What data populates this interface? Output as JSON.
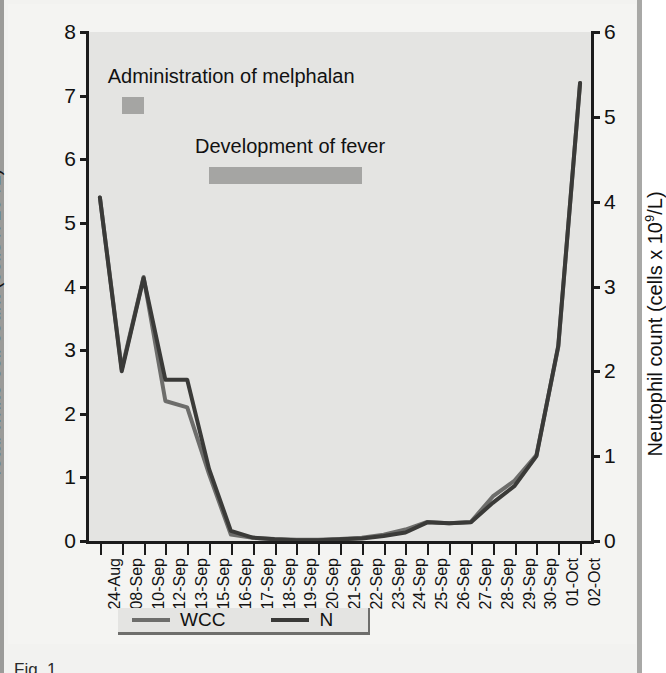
{
  "figure": {
    "background_color": "#f4f4f2",
    "plot_background_color": "#e4e4e2",
    "axis_color": "#1c1c1c"
  },
  "annotations": [
    {
      "name": "melphalan",
      "text": "Administration of melphalan",
      "bar_color": "#a5a5a3",
      "bar_start_category": "08-Sep",
      "bar_end_category": "10-Sep",
      "bar_y_value": 6.85
    },
    {
      "name": "fever",
      "text": "Development of fever",
      "bar_color": "#a5a5a3",
      "bar_start_category": "15-Sep",
      "bar_end_category": "22-Sep",
      "bar_y_value": 5.75
    }
  ],
  "legend": {
    "position": "below-axis",
    "items": [
      {
        "label": "WCC",
        "color": "#6d6d6b"
      },
      {
        "label": "N",
        "color": "#3a3a38"
      }
    ]
  },
  "caption": {
    "text": "Fig. 1"
  },
  "chart_data": {
    "type": "line",
    "title": "",
    "xlabel": "",
    "ylabel": "Total white cell count (cells x 10⁹/L)",
    "y2label": "Neutophil count (cells x 10⁹/L)",
    "ylim": [
      0,
      8
    ],
    "y2lim": [
      0,
      6
    ],
    "yticks": [
      0,
      1,
      2,
      3,
      4,
      5,
      6,
      7,
      8
    ],
    "y2ticks": [
      0,
      1,
      2,
      3,
      4,
      5,
      6
    ],
    "grid": false,
    "legend_position": "bottom",
    "categories": [
      "24-Aug",
      "08-Sep",
      "10-Sep",
      "12-Sep",
      "13-Sep",
      "15-Sep",
      "16-Sep",
      "17-Sep",
      "18-Sep",
      "19-Sep",
      "20-Sep",
      "21-Sep",
      "22-Sep",
      "23-Sep",
      "24-Sep",
      "25-Sep",
      "26-Sep",
      "27-Sep",
      "28-Sep",
      "29-Sep",
      "30-Sep",
      "01-Oct",
      "02-Oct"
    ],
    "series": [
      {
        "name": "WCC",
        "axis": "left",
        "color": "#6d6d6b",
        "values": [
          5.4,
          2.7,
          4.15,
          2.2,
          2.1,
          1.05,
          0.1,
          0.05,
          0.03,
          0.02,
          0.02,
          0.03,
          0.05,
          0.1,
          0.18,
          0.3,
          0.28,
          0.3,
          0.7,
          0.95,
          1.35,
          3.05,
          7.2
        ]
      },
      {
        "name": "N",
        "axis": "right",
        "color": "#3a3a38",
        "values": [
          4.05,
          2.0,
          3.1,
          1.9,
          1.9,
          0.85,
          0.12,
          0.04,
          0.02,
          0.01,
          0.01,
          0.02,
          0.03,
          0.06,
          0.1,
          0.22,
          0.21,
          0.22,
          0.45,
          0.65,
          1.0,
          2.3,
          5.4
        ]
      }
    ]
  }
}
